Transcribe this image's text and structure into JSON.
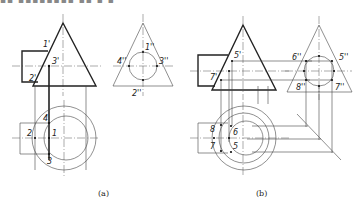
{
  "header": {
    "clipped_text": "▪▪ ▪▪▪▪▪▪▪▪ ▪▪ ▪ ▪"
  },
  "figures": [
    {
      "id": "a",
      "caption": "(a)",
      "front_view_labels": [
        "1'",
        "2'",
        "3'"
      ],
      "side_view_labels": [
        "1''",
        "2''",
        "3''",
        "4''"
      ],
      "top_view_labels": [
        "1",
        "2",
        "3",
        "4"
      ]
    },
    {
      "id": "b",
      "caption": "(b)",
      "front_view_labels": [
        "5'",
        "7'"
      ],
      "side_view_labels": [
        "5''",
        "6''",
        "7''",
        "8''"
      ],
      "top_view_labels": [
        "5",
        "6",
        "7",
        "8"
      ]
    }
  ],
  "colors": {
    "line": "#222222",
    "background": "#ffffff"
  }
}
